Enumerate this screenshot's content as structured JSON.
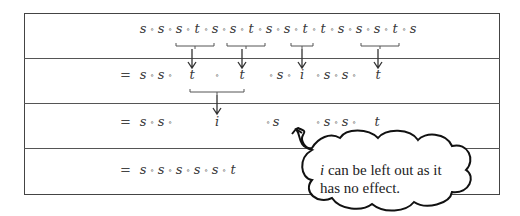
{
  "diagram": {
    "rows": [
      {
        "prefix": "",
        "symbols": [
          "s",
          "s",
          "s",
          "t",
          "s",
          "s",
          "t",
          "s",
          "s",
          "t",
          "t",
          "s",
          "s",
          "s",
          "t",
          "s"
        ],
        "operator": "∘",
        "text": "s ∘ s ∘ s ∘ t ∘ s ∘ s ∘ t ∘ s ∘ s ∘ t ∘ t ∘ s ∘ s ∘ s ∘ t ∘ s"
      },
      {
        "prefix": "=",
        "text": "= s ∘ s ∘ t ∘ t ∘ s ∘ i ∘ s ∘ s ∘ t",
        "items": [
          "s",
          "∘",
          "s",
          "∘",
          "t",
          "∘",
          "t",
          "∘",
          "s",
          "∘",
          "i",
          "∘",
          "s",
          "∘",
          "s",
          "∘",
          "t"
        ]
      },
      {
        "prefix": "=",
        "text": "= s ∘ s ∘ i ∘ s ∘ [i] ∘ s ∘ s ∘ t",
        "items": [
          "s",
          "∘",
          "s",
          "∘",
          "i",
          "∘",
          "s",
          "∘",
          "s",
          "∘",
          "s",
          "∘",
          "t"
        ]
      },
      {
        "prefix": "=",
        "text": "= s ∘ s ∘ s ∘ s ∘ s ∘ t",
        "items": [
          "s",
          "∘",
          "s",
          "∘",
          "s",
          "∘",
          "s",
          "∘",
          "s",
          "∘",
          "t"
        ]
      }
    ],
    "reductions": [
      {
        "from_row": 1,
        "group": "s ∘ t ∘ s",
        "to": "t"
      },
      {
        "from_row": 1,
        "group": "s ∘ t ∘ s",
        "to": "t"
      },
      {
        "from_row": 1,
        "group": "t ∘ t",
        "to": "i"
      },
      {
        "from_row": 1,
        "group": "s ∘ t ∘ s",
        "to": "t"
      },
      {
        "from_row": 2,
        "group": "t ∘ t",
        "to": "i"
      }
    ],
    "callout": {
      "symbol": "i",
      "text": "can be left out as it",
      "line2": "has no effect."
    }
  }
}
